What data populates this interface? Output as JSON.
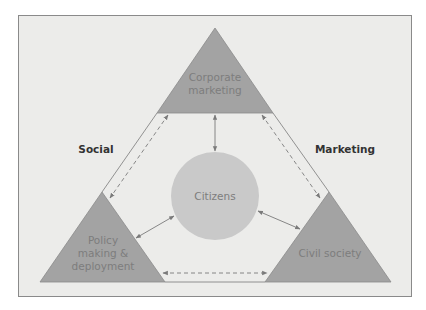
{
  "diagram": {
    "title": "",
    "side_labels": {
      "left": "Social",
      "right": "Marketing"
    },
    "nodes": {
      "top": {
        "lines": [
          "Corporate",
          "marketing"
        ],
        "shape": "triangle"
      },
      "bottom_left": {
        "lines": [
          "Policy",
          "making &",
          "deployment"
        ],
        "shape": "triangle"
      },
      "bottom_right": {
        "lines": [
          "Civil society"
        ],
        "shape": "triangle"
      },
      "center": {
        "lines": [
          "Citizens"
        ],
        "shape": "circle"
      }
    },
    "connections": [
      {
        "from": "top",
        "to": "center",
        "style": "solid",
        "direction": "both"
      },
      {
        "from": "bottom_left",
        "to": "center",
        "style": "solid",
        "direction": "both"
      },
      {
        "from": "bottom_right",
        "to": "center",
        "style": "solid",
        "direction": "both"
      },
      {
        "from": "top",
        "to": "bottom_left",
        "style": "dashed",
        "direction": "both"
      },
      {
        "from": "top",
        "to": "bottom_right",
        "style": "dashed",
        "direction": "both"
      },
      {
        "from": "bottom_left",
        "to": "bottom_right",
        "style": "dashed",
        "direction": "both"
      }
    ],
    "colors": {
      "background": "#ececea",
      "triangle_fill": "#a3a3a3",
      "circle_fill": "#c9c9c9",
      "node_text": "#7d7d7d",
      "side_text": "#333333",
      "lines": "#7a7a7a"
    }
  }
}
